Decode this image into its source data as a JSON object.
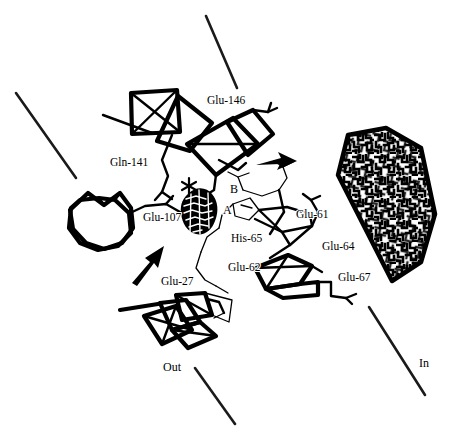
{
  "figure": {
    "background_color": "#ffffff",
    "ink_color": "#000000",
    "width": 457,
    "height": 430
  },
  "residue_labels": [
    {
      "id": "glu-146",
      "text": "Glu-146",
      "x": 207,
      "y": 104
    },
    {
      "id": "gln-141",
      "text": "Gln-141",
      "x": 110,
      "y": 166
    },
    {
      "id": "glu-107",
      "text": "Glu-107",
      "x": 143,
      "y": 221
    },
    {
      "id": "glu-61",
      "text": "Glu-61",
      "x": 296,
      "y": 218
    },
    {
      "id": "his-65",
      "text": "His-65",
      "x": 231,
      "y": 242
    },
    {
      "id": "glu-64",
      "text": "Glu-64",
      "x": 322,
      "y": 250
    },
    {
      "id": "glu-62",
      "text": "Glu-62",
      "x": 228,
      "y": 271
    },
    {
      "id": "glu-67",
      "text": "Glu-67",
      "x": 338,
      "y": 281
    },
    {
      "id": "glu-27",
      "text": "Glu-27",
      "x": 161,
      "y": 285
    }
  ],
  "site_labels": [
    {
      "id": "site-a",
      "text": "A",
      "x": 223,
      "y": 214
    },
    {
      "id": "site-b",
      "text": "B",
      "x": 230,
      "y": 193
    }
  ],
  "orientation_labels": [
    {
      "id": "out-label",
      "text": "Out",
      "x": 163,
      "y": 371
    },
    {
      "id": "in-label",
      "text": "In",
      "x": 419,
      "y": 367
    }
  ],
  "markers": {
    "asterisk": {
      "name": "asterisk-marker",
      "x": 189,
      "y": 186
    }
  },
  "arrows": [
    {
      "id": "arrow-right",
      "direction": "right",
      "x": 262,
      "y": 162
    },
    {
      "id": "arrow-up-right",
      "direction": "up-right",
      "x": 145,
      "y": 265
    }
  ],
  "membrane_lines": [
    {
      "id": "membrane-top-left",
      "x1": 16,
      "y1": 93,
      "x2": 76,
      "y2": 178
    },
    {
      "id": "membrane-top-right",
      "x1": 206,
      "y1": 16,
      "x2": 237,
      "y2": 88
    },
    {
      "id": "membrane-bottom-left",
      "x1": 195,
      "y1": 368,
      "x2": 235,
      "y2": 424
    },
    {
      "id": "membrane-bottom-right",
      "x1": 369,
      "y1": 307,
      "x2": 425,
      "y2": 395
    }
  ],
  "regions": {
    "hexagon": {
      "name": "textured-hexagon-region",
      "description": "dense maze-textured hexagonal block",
      "points": "348,135 386,128 421,148 435,214 421,262 392,281 338,175"
    },
    "density_blob": {
      "name": "retinal-density-blob",
      "description": "dense mesh-filled chromophore density"
    }
  }
}
